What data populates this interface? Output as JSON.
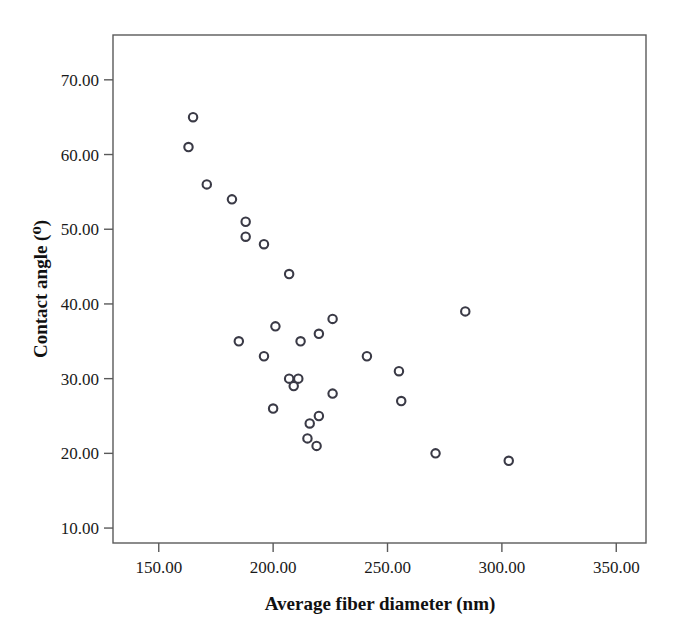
{
  "chart_data": {
    "type": "scatter",
    "title": "",
    "xlabel": "Average fiber diameter (nm)",
    "ylabel": "Contact angle (⁰)",
    "xlim": [
      130,
      363
    ],
    "ylim": [
      8,
      76
    ],
    "xticks": [
      150,
      200,
      250,
      300,
      350
    ],
    "yticks": [
      10,
      20,
      30,
      40,
      50,
      60,
      70
    ],
    "xtick_labels": [
      "150.00",
      "200.00",
      "250.00",
      "300.00",
      "350.00"
    ],
    "ytick_labels": [
      "10.00",
      "20.00",
      "30.00",
      "40.00",
      "50.00",
      "60.00",
      "70.00"
    ],
    "grid": false,
    "legend": "none",
    "marker": "open-circle",
    "marker_color": "#3a3a46",
    "marker_fill": "#ffffff",
    "frame_color": "#5a5a5a",
    "background": "#ffffff",
    "points": [
      {
        "x": 165,
        "y": 65
      },
      {
        "x": 163,
        "y": 61
      },
      {
        "x": 171,
        "y": 56
      },
      {
        "x": 182,
        "y": 54
      },
      {
        "x": 188,
        "y": 51
      },
      {
        "x": 188,
        "y": 49
      },
      {
        "x": 196,
        "y": 48
      },
      {
        "x": 207,
        "y": 44
      },
      {
        "x": 284,
        "y": 39
      },
      {
        "x": 226,
        "y": 38
      },
      {
        "x": 201,
        "y": 37
      },
      {
        "x": 220,
        "y": 36
      },
      {
        "x": 185,
        "y": 35
      },
      {
        "x": 212,
        "y": 35
      },
      {
        "x": 241,
        "y": 33
      },
      {
        "x": 196,
        "y": 33
      },
      {
        "x": 255,
        "y": 31
      },
      {
        "x": 207,
        "y": 30
      },
      {
        "x": 211,
        "y": 30
      },
      {
        "x": 209,
        "y": 29
      },
      {
        "x": 226,
        "y": 28
      },
      {
        "x": 256,
        "y": 27
      },
      {
        "x": 200,
        "y": 26
      },
      {
        "x": 220,
        "y": 25
      },
      {
        "x": 216,
        "y": 24
      },
      {
        "x": 215,
        "y": 22
      },
      {
        "x": 219,
        "y": 21
      },
      {
        "x": 271,
        "y": 20
      },
      {
        "x": 303,
        "y": 19
      }
    ]
  }
}
